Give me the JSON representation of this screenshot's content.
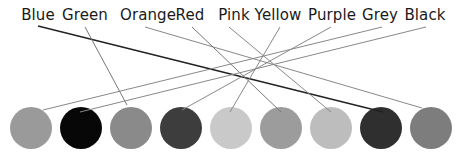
{
  "labels": [
    {
      "text": "Blue",
      "x": 38
    },
    {
      "text": "Green",
      "x": 85
    },
    {
      "text": "Orange",
      "x": 148
    },
    {
      "text": "Red",
      "x": 190
    },
    {
      "text": "Pink",
      "x": 234
    },
    {
      "text": "Yellow",
      "x": 278
    },
    {
      "text": "Purple",
      "x": 332
    },
    {
      "text": "Grey",
      "x": 380
    },
    {
      "text": "Black",
      "x": 425
    }
  ],
  "circles": [
    {
      "x": 31,
      "y": 128,
      "color": "#9a9a9a"
    },
    {
      "x": 81,
      "y": 128,
      "color": "#070707"
    },
    {
      "x": 131,
      "y": 128,
      "color": "#8a8a8a"
    },
    {
      "x": 181,
      "y": 128,
      "color": "#3d3d3d"
    },
    {
      "x": 231,
      "y": 128,
      "color": "#c9c9c9"
    },
    {
      "x": 281,
      "y": 128,
      "color": "#9c9c9c"
    },
    {
      "x": 331,
      "y": 128,
      "color": "#bdbdbd"
    },
    {
      "x": 381,
      "y": 128,
      "color": "#2f2f2f"
    },
    {
      "x": 431,
      "y": 128,
      "color": "#7d7d7d"
    }
  ],
  "connections": [
    {
      "label": "Blue",
      "x1": 38,
      "y1": 26,
      "x2": 383,
      "y2": 112,
      "color": "#222222",
      "width": 1.4
    },
    {
      "label": "Green",
      "x1": 85,
      "y1": 27,
      "x2": 127,
      "y2": 105,
      "color": "#777777",
      "width": 1
    },
    {
      "label": "Orange",
      "x1": 145,
      "y1": 27,
      "x2": 422,
      "y2": 108,
      "color": "#888888",
      "width": 1
    },
    {
      "label": "Red",
      "x1": 192,
      "y1": 27,
      "x2": 281,
      "y2": 112,
      "color": "#777777",
      "width": 1
    },
    {
      "label": "Pink",
      "x1": 229,
      "y1": 27,
      "x2": 331,
      "y2": 112,
      "color": "#888888",
      "width": 1
    },
    {
      "label": "Yellow",
      "x1": 280,
      "y1": 27,
      "x2": 230,
      "y2": 112,
      "color": "#888888",
      "width": 1
    },
    {
      "label": "Purple",
      "x1": 331,
      "y1": 27,
      "x2": 182,
      "y2": 110,
      "color": "#888888",
      "width": 1
    },
    {
      "label": "Grey",
      "x1": 382,
      "y1": 27,
      "x2": 43,
      "y2": 110,
      "color": "#888888",
      "width": 1
    },
    {
      "label": "Black",
      "x1": 426,
      "y1": 27,
      "x2": 80,
      "y2": 112,
      "color": "#888888",
      "width": 1
    }
  ]
}
